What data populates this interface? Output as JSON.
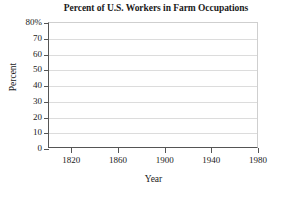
{
  "chart_data": {
    "type": "line",
    "title": "Percent of U.S. Workers in Farm Occupations",
    "xlabel": "Year",
    "ylabel": "Percent",
    "xlim": [
      1800,
      1980
    ],
    "ylim": [
      0,
      80
    ],
    "grid": true,
    "legend": false,
    "legend_position": "none",
    "x_ticks": [
      1820,
      1860,
      1900,
      1940,
      1980
    ],
    "x_tick_labels": [
      "1820",
      "1860",
      "1900",
      "1940",
      "1980"
    ],
    "y_ticks": [
      0,
      10,
      20,
      30,
      40,
      50,
      60,
      70,
      80
    ],
    "y_tick_labels": [
      "0",
      "10",
      "20",
      "30",
      "40",
      "50",
      "60",
      "70",
      "80%"
    ],
    "series": [
      {
        "name": "Percent of U.S. workers in farm occupations",
        "x": [],
        "values": []
      }
    ],
    "annotations": []
  },
  "colors": {
    "background": "#ffffff",
    "gridline": "#dcdcdc",
    "axis": "#555555",
    "frame": "#cfcfcf",
    "text": "#1a1a1a"
  }
}
